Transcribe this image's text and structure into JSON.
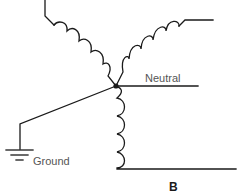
{
  "diagram": {
    "type": "wye-connected transformer winding schematic",
    "labels": {
      "neutral": "Neutral",
      "ground": "Ground",
      "phase": "B"
    },
    "colors": {
      "line": "#1a1a1a",
      "label": "#555555",
      "background": "#ffffff"
    },
    "nodes": {
      "center": {
        "x": 116,
        "y": 86
      }
    },
    "elements": [
      {
        "name": "left-winding",
        "coils": 4
      },
      {
        "name": "right-winding",
        "coils": 4
      },
      {
        "name": "vertical-winding",
        "coils": 4
      },
      {
        "name": "neutral-line"
      },
      {
        "name": "ground-line"
      },
      {
        "name": "ground-symbol"
      }
    ]
  }
}
